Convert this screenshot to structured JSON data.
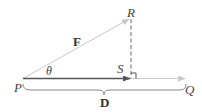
{
  "diagram": {
    "type": "vector-projection",
    "points": {
      "P": {
        "label": "P"
      },
      "Q": {
        "label": "Q"
      },
      "R": {
        "label": "R"
      },
      "S": {
        "label": "S"
      }
    },
    "vectors": {
      "force": {
        "label": "F",
        "from": "P",
        "to": "R"
      },
      "displacement": {
        "label": "D",
        "from": "P",
        "to": "Q"
      },
      "projection": {
        "from": "P",
        "to": "S"
      }
    },
    "angle": {
      "label": "θ",
      "at": "P"
    },
    "right_angle_marker": {
      "at": "S"
    },
    "colors": {
      "force_line": "#c8c8c8",
      "projection_line": "#555555",
      "dashed_line": "#666666",
      "baseline": "#cccccc",
      "brace": "#888888",
      "text": "#444444"
    }
  }
}
